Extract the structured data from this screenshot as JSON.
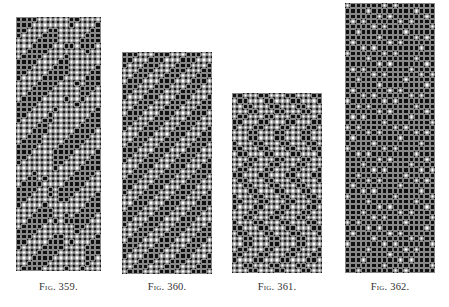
{
  "figures": [
    {
      "label": "Fig. 359.",
      "x": 16,
      "y": 17,
      "cols": 16,
      "rows": 48,
      "caption_x": 16,
      "caption_y": 281,
      "pattern": "stripe-diagonal",
      "seed": 1
    },
    {
      "label": "Fig. 360.",
      "x": 122,
      "y": 52,
      "cols": 17,
      "rows": 42,
      "caption_x": 122,
      "caption_y": 281,
      "pattern": "twill",
      "seed": 2
    },
    {
      "label": "Fig. 361.",
      "x": 232,
      "y": 93,
      "cols": 17,
      "rows": 34,
      "caption_x": 232,
      "caption_y": 281,
      "pattern": "broken",
      "seed": 3
    },
    {
      "label": "Fig. 362.",
      "x": 345,
      "y": 3,
      "cols": 17,
      "rows": 51,
      "caption_x": 345,
      "caption_y": 281,
      "pattern": "dense",
      "seed": 4
    }
  ],
  "cell_size": 5.3,
  "colors": {
    "black_cell": "#111111",
    "white_cell": "#ffffff",
    "grid_line": "#888888",
    "caption": "#333333"
  }
}
